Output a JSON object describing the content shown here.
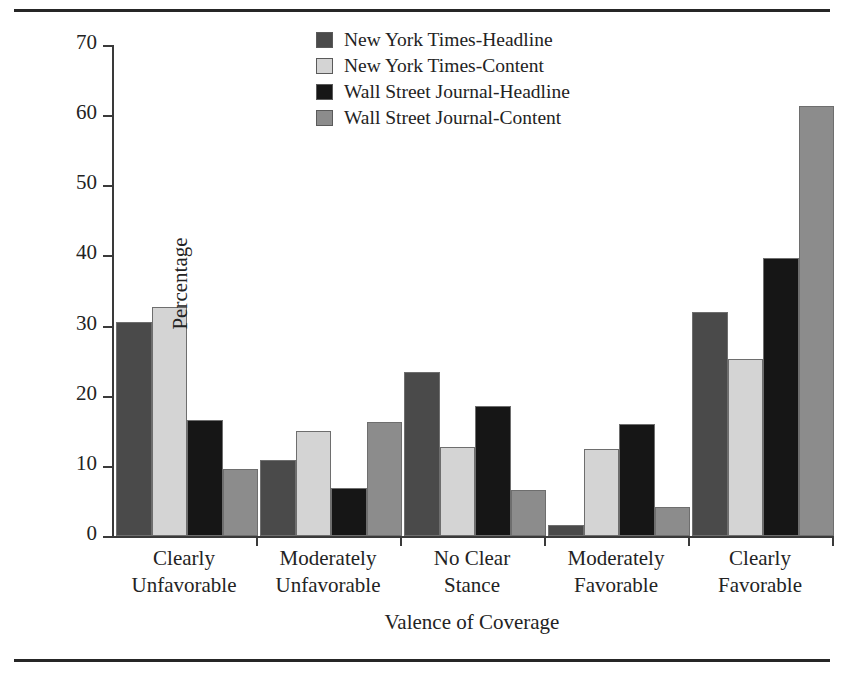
{
  "figure": {
    "rules": {
      "top": true,
      "bottom": true
    }
  },
  "chart_data": {
    "type": "bar",
    "title": "",
    "xlabel": "Valence of Coverage",
    "ylabel": "Percentage",
    "ylim": [
      0,
      70
    ],
    "ytick_values": [
      0,
      10,
      20,
      30,
      40,
      50,
      60,
      70
    ],
    "ytick_labels": [
      "0",
      "10",
      "20",
      "30",
      "40",
      "50",
      "60",
      "70"
    ],
    "grid": false,
    "legend_position": "top-center",
    "categories": [
      "Clearly Unfavorable",
      "Moderately Unfavorable",
      "No Clear Stance",
      "Moderately Favorable",
      "Clearly Favorable"
    ],
    "category_lines": [
      [
        "Clearly",
        "Unfavorable"
      ],
      [
        "Moderately",
        "Unfavorable"
      ],
      [
        "No Clear",
        "Stance"
      ],
      [
        "Moderately",
        "Favorable"
      ],
      [
        "Clearly",
        "Favorable"
      ]
    ],
    "series": [
      {
        "name": "New York Times-Headline",
        "color": "#4a4a4a",
        "values": [
          30.5,
          10.8,
          23.4,
          1.6,
          31.9
        ]
      },
      {
        "name": "New York Times-Content",
        "color": "#d4d4d4",
        "values": [
          32.6,
          15.0,
          12.7,
          12.4,
          25.3
        ]
      },
      {
        "name": "Wall Street Journal-Headline",
        "color": "#161616",
        "values": [
          16.6,
          6.9,
          18.6,
          16.0,
          39.6
        ]
      },
      {
        "name": "Wall Street Journal-Content",
        "color": "#8c8c8c",
        "values": [
          9.5,
          16.3,
          6.6,
          4.1,
          61.3
        ]
      }
    ]
  }
}
